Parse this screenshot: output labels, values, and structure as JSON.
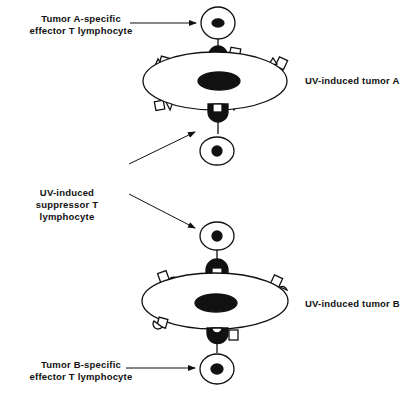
{
  "labels": {
    "effector_a": [
      "Tumor A-specific",
      "effector T lymphocyte"
    ],
    "tumor_a": "UV-induced tumor A",
    "suppressor": [
      "UV-induced",
      "suppressor T lymphocyte"
    ],
    "tumor_b": "UV-induced tumor B",
    "effector_b": [
      "Tumor B-specific",
      "effector T lymphocyte"
    ]
  },
  "colors": {
    "stroke": "#111111",
    "fill": "#ffffff"
  }
}
